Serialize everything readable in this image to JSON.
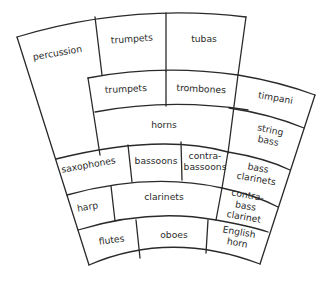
{
  "diagram": {
    "type": "orchestra-seating-plan",
    "sections": [
      {
        "id": "percussion",
        "label": "percussion"
      },
      {
        "id": "trumpets-back",
        "label": "trumpets"
      },
      {
        "id": "tubas",
        "label": "tubas"
      },
      {
        "id": "trumpets-front",
        "label": "trumpets"
      },
      {
        "id": "trombones",
        "label": "trombones"
      },
      {
        "id": "timpani",
        "label": "timpani"
      },
      {
        "id": "horns",
        "label": "horns"
      },
      {
        "id": "string-bass",
        "label_lines": [
          "string",
          "bass"
        ]
      },
      {
        "id": "saxophones",
        "label": "saxophones"
      },
      {
        "id": "bassoons",
        "label": "bassoons"
      },
      {
        "id": "contrabassoons",
        "label_lines": [
          "contra-",
          "bassoons"
        ]
      },
      {
        "id": "bass-clarinets",
        "label_lines": [
          "bass",
          "clarinets"
        ]
      },
      {
        "id": "harp",
        "label": "harp"
      },
      {
        "id": "clarinets",
        "label": "clarinets"
      },
      {
        "id": "contrabass-clarinet",
        "label_lines": [
          "contra-",
          "bass",
          "clarinet"
        ]
      },
      {
        "id": "flutes",
        "label": "flutes"
      },
      {
        "id": "oboes",
        "label": "oboes"
      },
      {
        "id": "english-horn",
        "label_lines": [
          "English",
          "horn"
        ]
      }
    ]
  }
}
